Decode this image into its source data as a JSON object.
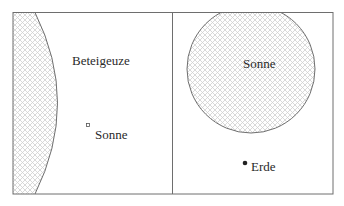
{
  "left_panel": {
    "star_label": "Beteigeuze",
    "sun_label": "Sonne"
  },
  "right_panel": {
    "sun_label": "Sonne",
    "earth_label": "Erde"
  },
  "colors": {
    "stroke": "#6e6e6e",
    "hatch": "#c9c9c9",
    "text": "#2a2a2a",
    "background": "#ffffff"
  }
}
